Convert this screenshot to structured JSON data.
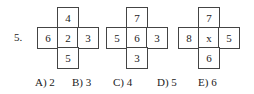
{
  "question": {
    "number": "5.",
    "figures": [
      {
        "top": "4",
        "left": "6",
        "center": "2",
        "right": "3",
        "bottom": "5"
      },
      {
        "top": "7",
        "left": "5",
        "center": "6",
        "right": "3",
        "bottom": "3"
      },
      {
        "top": "7",
        "left": "8",
        "center": "x",
        "right": "5",
        "bottom": "6"
      }
    ],
    "options": [
      {
        "label": "A) 2"
      },
      {
        "label": "B) 3"
      },
      {
        "label": "C) 4"
      },
      {
        "label": "D) 5"
      },
      {
        "label": "E) 6"
      }
    ]
  }
}
